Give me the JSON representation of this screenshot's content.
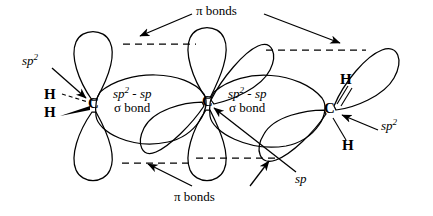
{
  "figure": {
    "canvas": {
      "width": 433,
      "height": 216
    },
    "stroke_color": "#000000",
    "background_color": "#ffffff"
  },
  "atoms": [
    {
      "id": "c-left",
      "symbol": "C",
      "x": 94,
      "y": 105
    },
    {
      "id": "c-middle",
      "symbol": "C",
      "x": 208,
      "y": 103
    },
    {
      "id": "c-right",
      "symbol": "C",
      "x": 330,
      "y": 110
    },
    {
      "id": "h-left-upper",
      "symbol": "H",
      "x": 50,
      "y": 96,
      "bond_style": "dashed"
    },
    {
      "id": "h-left-lower",
      "symbol": "H",
      "x": 50,
      "y": 114,
      "bond_style": "wedge"
    },
    {
      "id": "h-right-upper",
      "symbol": "H",
      "x": 346,
      "y": 81,
      "bond_style": "line"
    },
    {
      "id": "h-right-lower",
      "symbol": "H",
      "x": 348,
      "y": 147,
      "bond_style": "line"
    }
  ],
  "labels": {
    "sp2_left": {
      "text": "sp",
      "sup": "2",
      "x": 22,
      "y": 55
    },
    "sp2_right": {
      "text": "sp",
      "sup": "2",
      "x": 382,
      "y": 120
    },
    "sp_center": {
      "text": "sp",
      "x": 296,
      "y": 174
    },
    "sigma_bond_left": {
      "line1": "sp",
      "line1_sup": "2",
      "line1_rest": " - sp",
      "line2": "σ bond",
      "x": 117,
      "y": 90
    },
    "sigma_bond_right": {
      "line1": "sp",
      "line1_sup": "2",
      "line1_rest": " - sp",
      "line2": "σ bond",
      "x": 232,
      "y": 90
    },
    "pi_bonds_top": {
      "text": "π bonds",
      "x": 196,
      "y": 6
    },
    "pi_bonds_bottom": {
      "text": "π bonds",
      "x": 174,
      "y": 192
    }
  },
  "annotation_arrows": [
    {
      "id": "arrow-sp2-left",
      "from": [
        52,
        68
      ],
      "to": [
        86,
        98
      ],
      "points_to": "c-left"
    },
    {
      "id": "arrow-sp2-right",
      "from": [
        378,
        130
      ],
      "to": [
        340,
        115
      ],
      "points_to": "c-right"
    },
    {
      "id": "arrow-sp-center",
      "from": [
        296,
        172
      ],
      "to": [
        213,
        108
      ],
      "points_to": "c-middle"
    },
    {
      "id": "arrow-pi-top-left",
      "from": [
        192,
        14
      ],
      "to": [
        140,
        36
      ],
      "points_to": "pi-dash-top-left"
    },
    {
      "id": "arrow-pi-top-right",
      "from": [
        264,
        14
      ],
      "to": [
        340,
        43
      ],
      "points_to": "pi-dash-top-right"
    },
    {
      "id": "arrow-pi-bottom-left",
      "from": [
        192,
        186
      ],
      "to": [
        148,
        163
      ],
      "points_to": "pi-dash-bottom-left"
    },
    {
      "id": "arrow-pi-bottom-right",
      "from": [
        250,
        186
      ],
      "to": [
        268,
        160
      ],
      "points_to": "pi-dash-bottom-right"
    }
  ],
  "pi_dashed_lines": [
    {
      "id": "pi-dash-top-left",
      "x1": 123,
      "y1": 44,
      "x2": 196,
      "y2": 44
    },
    {
      "id": "pi-dash-top-right",
      "x1": 266,
      "y1": 50,
      "x2": 366,
      "y2": 50
    },
    {
      "id": "pi-dash-bottom-left",
      "x1": 122,
      "y1": 163,
      "x2": 192,
      "y2": 163
    },
    {
      "id": "pi-dash-bottom-right",
      "x1": 196,
      "y1": 158,
      "x2": 278,
      "y2": 158
    }
  ],
  "orbitals": [
    {
      "id": "p-lobe-left-up",
      "type": "p",
      "atom": "c-left",
      "direction": "up"
    },
    {
      "id": "p-lobe-left-down",
      "type": "p",
      "atom": "c-left",
      "direction": "down"
    },
    {
      "id": "p-lobe-middle-up",
      "type": "p",
      "atom": "c-middle",
      "direction": "up"
    },
    {
      "id": "p-lobe-middle-down",
      "type": "p",
      "atom": "c-middle",
      "direction": "down"
    },
    {
      "id": "sp-lobe-middle-upper-right",
      "type": "sp",
      "atom": "c-middle",
      "direction": "upper-right"
    },
    {
      "id": "sp-lobe-middle-lower-left",
      "type": "sp",
      "atom": "c-middle",
      "direction": "lower-left"
    },
    {
      "id": "sp-lobe-right-upper",
      "type": "sp2",
      "atom": "c-right",
      "direction": "upper-right"
    },
    {
      "id": "sp-lobe-right-lower",
      "type": "sp2",
      "atom": "c-right",
      "direction": "lower-left"
    },
    {
      "id": "sigma-overlap-left",
      "type": "sigma-overlap",
      "between": [
        "c-left",
        "c-middle"
      ]
    },
    {
      "id": "sigma-overlap-right",
      "type": "sigma-overlap",
      "between": [
        "c-middle",
        "c-right"
      ]
    }
  ]
}
